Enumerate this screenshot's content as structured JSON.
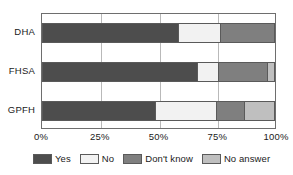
{
  "chart_data": {
    "type": "bar",
    "orientation": "horizontal",
    "stacked": true,
    "stack_mode": "percent",
    "title": "",
    "subtitle": "",
    "xlabel": "",
    "ylabel": "",
    "xlim": [
      0,
      100
    ],
    "xticks": [
      0,
      25,
      50,
      75,
      100
    ],
    "xticklabels": [
      "0%",
      "25%",
      "50%",
      "75%",
      "100%"
    ],
    "categories": [
      "DHA",
      "FHSA",
      "GPFH"
    ],
    "grid": true,
    "grid_axis": "x",
    "legend_position": "bottom",
    "series": [
      {
        "name": "Yes",
        "color": "#4d4d4d",
        "values": [
          59,
          67,
          49
        ]
      },
      {
        "name": "No",
        "color": "#f2f2f2",
        "values": [
          18,
          9,
          26
        ]
      },
      {
        "name": "Don't know",
        "color": "#7f7f7f",
        "values": [
          23,
          21,
          12
        ]
      },
      {
        "name": "No answer",
        "color": "#bfbfbf",
        "values": [
          0,
          3,
          13
        ]
      }
    ]
  },
  "axis": {
    "ytick_labels": [
      "DHA",
      "FHSA",
      "GPFH"
    ],
    "xtick_labels": [
      "0%",
      "25%",
      "50%",
      "75%",
      "100%"
    ]
  },
  "legend": {
    "items": [
      {
        "label": "Yes"
      },
      {
        "label": "No"
      },
      {
        "label": "Don't know"
      },
      {
        "label": "No answer"
      }
    ]
  },
  "colors": {
    "yes": "#4d4d4d",
    "no": "#f2f2f2",
    "dont_know": "#7f7f7f",
    "no_answer": "#bfbfbf",
    "frame": "#6e6e6e",
    "grid": "#b9b9b9",
    "text": "#1a1a1a"
  }
}
